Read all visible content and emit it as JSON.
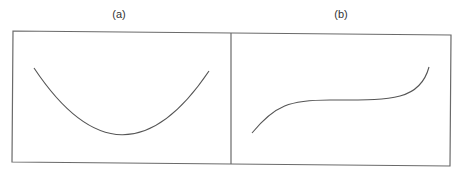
{
  "panels": [
    {
      "label": "(a)",
      "shape": "U-shaped parabola (convex, single minimum)"
    },
    {
      "label": "(b)",
      "shape": "S-shaped cubic curve with central plateau (inflection)"
    }
  ],
  "colors": {
    "border": "#6a6a6a",
    "curve": "#555555"
  }
}
